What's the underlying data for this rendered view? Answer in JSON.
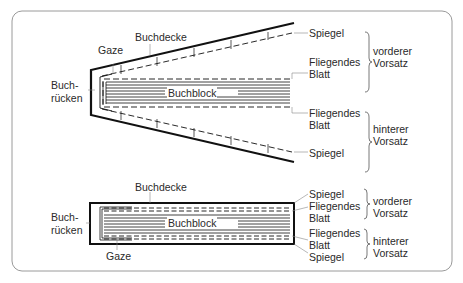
{
  "figure": {
    "open_book": {
      "labels": {
        "buchdecke": "Buchdecke",
        "gaze": "Gaze",
        "buchruecken_1": "Buch-",
        "buchruecken_2": "rücken",
        "buchblock": "Buchblock",
        "spiegel_front": "Spiegel",
        "fliegendes_front_1": "Fliegendes",
        "fliegendes_front_2": "Blatt",
        "fliegendes_back_1": "Fliegendes",
        "fliegendes_back_2": "Blatt",
        "spiegel_back": "Spiegel",
        "vorderer_1": "vorderer",
        "vorderer_2": "Vorsatz",
        "hinterer_1": "hinterer",
        "hinterer_2": "Vorsatz"
      }
    },
    "closed_book": {
      "labels": {
        "buchdecke": "Buchdecke",
        "gaze": "Gaze",
        "buchruecken_1": "Buch-",
        "buchruecken_2": "rücken",
        "buchblock": "Buchblock",
        "spiegel_front": "Spiegel",
        "fliegendes_front_1": "Fliegendes",
        "fliegendes_front_2": "Blatt",
        "fliegendes_back_1": "Fliegendes",
        "fliegendes_back_2": "Blatt",
        "spiegel_back": "Spiegel",
        "vorderer_1": "vorderer",
        "vorderer_2": "Vorsatz",
        "hinterer_1": "hinterer",
        "hinterer_2": "Vorsatz"
      }
    }
  }
}
